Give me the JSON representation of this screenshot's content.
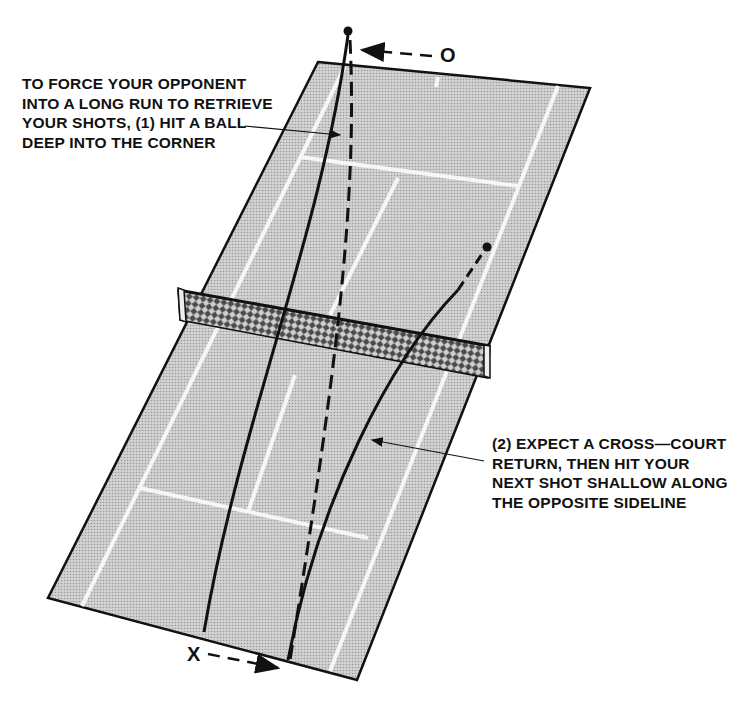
{
  "diagram": {
    "colors": {
      "court_fill": "#c9c9c9",
      "court_lines": "#f4f4f4",
      "ink": "#111111",
      "background": "#ffffff"
    },
    "players": {
      "opponent_label": "O",
      "player_label": "X"
    },
    "captions": {
      "step1": {
        "lines": [
          "TO FORCE YOUR OPPONENT",
          "INTO A LONG RUN TO RETRIEVE",
          "YOUR SHOTS, (1) HIT A BALL",
          "DEEP INTO THE CORNER"
        ]
      },
      "step2": {
        "lines": [
          "(2) EXPECT A CROSS—COURT",
          "RETURN, THEN HIT YOUR",
          "NEXT SHOT SHALLOW ALONG",
          "THE OPPOSITE SIDELINE"
        ]
      }
    },
    "elements": [
      "court",
      "net",
      "shot-1-deep-corner",
      "return-cross-court",
      "shot-2-shallow-sideline",
      "opponent-movement-arrow",
      "player-movement-arrow"
    ]
  }
}
